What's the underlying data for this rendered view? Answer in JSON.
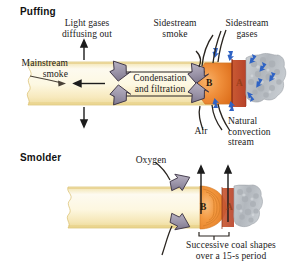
{
  "figure": {
    "sections": [
      {
        "id": "puffing",
        "title": "Puffing"
      },
      {
        "id": "smolder",
        "title": "Smolder"
      }
    ],
    "labels": {
      "light_gases": "Light gases\ndiffusing out",
      "sidestream_smoke": "Sidestream\nsmoke",
      "sidestream_gases": "Sidestream\ngases",
      "mainstream_smoke": "Mainstream\nsmoke",
      "condensation": "Condensation\nand filtration",
      "air": "Air",
      "natural_convection": "Natural\nconvection\nstream",
      "oxygen": "Oxygen",
      "successive_coal": "Successive coal shapes\nover a 15-s period"
    },
    "zones": {
      "puff_b": "B",
      "puff_a": "A",
      "smolder_b": "B",
      "smolder_a": "A"
    },
    "colors": {
      "paper_light": "#fdf8e4",
      "paper_mid": "#f6e6b4",
      "paper_edge": "#d8b659",
      "coal_orange": "#f39c4c",
      "coal_deep": "#e2741f",
      "zone_a_red": "#c0472a",
      "ash_gray": "#b9bdc2",
      "arrow_gray": "#9a93a6",
      "arrow_outline": "#3b3243",
      "air_blue": "#2f63c4",
      "text": "#1a1a1a"
    }
  }
}
